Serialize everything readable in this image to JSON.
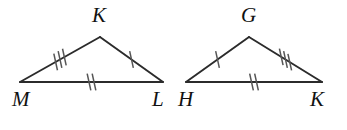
{
  "figure": {
    "background_color": "#ffffff",
    "line_color": "#2b2b2b",
    "tick_color": "#555555",
    "label_color": "#111111"
  },
  "triangles": [
    {
      "id": "triangle-mkl",
      "name": "MKL",
      "vertices": [
        {
          "label": "M",
          "role": "bottom-left",
          "x": 20,
          "y": 82,
          "label_x": 12,
          "label_y": 106
        },
        {
          "label": "K",
          "role": "apex",
          "x": 100,
          "y": 37,
          "label_x": 92,
          "label_y": 22
        },
        {
          "label": "L",
          "role": "bottom-right",
          "x": 163,
          "y": 82,
          "label_x": 152,
          "label_y": 106
        }
      ],
      "edges": [
        {
          "name": "MK",
          "from": "M",
          "to": "K",
          "ticks": 3
        },
        {
          "name": "KL",
          "from": "K",
          "to": "L",
          "ticks": 1
        },
        {
          "name": "ML",
          "from": "M",
          "to": "L",
          "ticks": 2
        }
      ]
    },
    {
      "id": "triangle-hgk",
      "name": "HGK",
      "vertices": [
        {
          "label": "H",
          "role": "bottom-left",
          "x": 186,
          "y": 82,
          "label_x": 178,
          "label_y": 106
        },
        {
          "label": "G",
          "role": "apex",
          "x": 249,
          "y": 37,
          "label_x": 241,
          "label_y": 22
        },
        {
          "label": "K",
          "role": "bottom-right",
          "x": 322,
          "y": 82,
          "label_x": 310,
          "label_y": 106
        }
      ],
      "edges": [
        {
          "name": "HG",
          "from": "H",
          "to": "G",
          "ticks": 1
        },
        {
          "name": "GK",
          "from": "G",
          "to": "K",
          "ticks": 3
        },
        {
          "name": "HK",
          "from": "H",
          "to": "K",
          "ticks": 2
        }
      ]
    }
  ],
  "congruence_legend": [
    {
      "ticks": 1,
      "pair": "KL ≅ HG"
    },
    {
      "ticks": 2,
      "pair": "ML ≅ HK"
    },
    {
      "ticks": 3,
      "pair": "MK ≅ GK"
    }
  ]
}
